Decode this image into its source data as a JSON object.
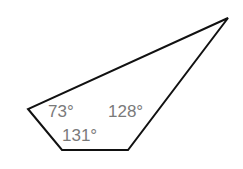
{
  "diagram": {
    "type": "quadrilateral",
    "stroke_color": "#111111",
    "label_color": "#7a7a7a",
    "vertices": [
      {
        "name": "top-right",
        "x": 228,
        "y": 18
      },
      {
        "name": "left",
        "x": 28,
        "y": 109
      },
      {
        "name": "bottom-left",
        "x": 62,
        "y": 150
      },
      {
        "name": "bottom-right",
        "x": 128,
        "y": 150
      }
    ],
    "angles": [
      {
        "label": "73°",
        "value": 73,
        "x": 48,
        "y": 117
      },
      {
        "label": "128°",
        "value": 128,
        "x": 108,
        "y": 117
      },
      {
        "label": "131°",
        "value": 131,
        "x": 62,
        "y": 141
      }
    ]
  }
}
